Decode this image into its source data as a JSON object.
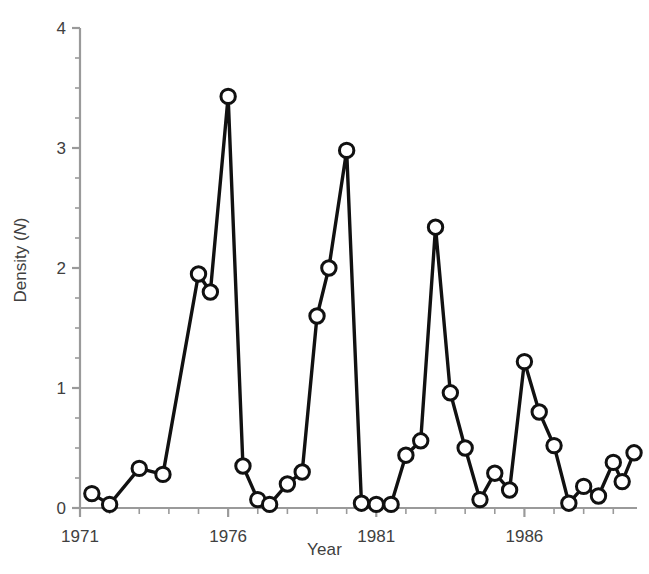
{
  "chart_data": {
    "type": "line",
    "title": "",
    "xlabel": "Year",
    "ylabel": "Density (N)",
    "ylabel_plain": "Density (",
    "ylabel_italic": "N",
    "ylabel_close": ")",
    "xlim": [
      1971.0,
      1989.8
    ],
    "ylim": [
      0,
      4
    ],
    "ytick_labels": [
      "0",
      "1",
      "2",
      "3",
      "4"
    ],
    "ytick_values": [
      0,
      1,
      2,
      3,
      4
    ],
    "yminor_step": 0.25,
    "xtick_labels": [
      "1971",
      "1976",
      "1981",
      "1986"
    ],
    "xtick_values": [
      1971,
      1976,
      1981,
      1986
    ],
    "xminor_step": 1,
    "grid": false,
    "legend": null,
    "marker": "open-circle",
    "marker_facecolor": "#ffffff",
    "marker_edgecolor": "#111111",
    "line_color": "#111111",
    "axis_color": "#9a9a9a",
    "x": [
      1971.4,
      1972.0,
      1973.0,
      1973.8,
      1975.0,
      1975.4,
      1976.0,
      1976.5,
      1977.0,
      1977.4,
      1978.0,
      1978.5,
      1979.0,
      1979.4,
      1980.0,
      1980.5,
      1981.0,
      1981.5,
      1982.0,
      1982.5,
      1983.0,
      1983.5,
      1984.0,
      1984.5,
      1985.0,
      1985.5,
      1986.0,
      1986.5,
      1987.0,
      1987.5,
      1988.0,
      1988.5,
      1989.0,
      1989.5
    ],
    "series": [
      {
        "name": "Density",
        "points": [
          {
            "year": 1971.4,
            "value": 0.12
          },
          {
            "year": 1972.0,
            "value": 0.03
          },
          {
            "year": 1973.0,
            "value": 0.33
          },
          {
            "year": 1973.8,
            "value": 0.28
          },
          {
            "year": 1975.0,
            "value": 1.95
          },
          {
            "year": 1975.4,
            "value": 1.8
          },
          {
            "year": 1976.0,
            "value": 3.43
          },
          {
            "year": 1976.5,
            "value": 0.35
          },
          {
            "year": 1977.0,
            "value": 0.07
          },
          {
            "year": 1977.4,
            "value": 0.03
          },
          {
            "year": 1978.0,
            "value": 0.2
          },
          {
            "year": 1978.5,
            "value": 0.3
          },
          {
            "year": 1979.0,
            "value": 1.6
          },
          {
            "year": 1979.4,
            "value": 2.0
          },
          {
            "year": 1980.0,
            "value": 2.98
          },
          {
            "year": 1980.5,
            "value": 0.04
          },
          {
            "year": 1981.0,
            "value": 0.03
          },
          {
            "year": 1981.5,
            "value": 0.03
          },
          {
            "year": 1982.0,
            "value": 0.44
          },
          {
            "year": 1982.5,
            "value": 0.56
          },
          {
            "year": 1983.0,
            "value": 2.34
          },
          {
            "year": 1983.5,
            "value": 0.96
          },
          {
            "year": 1984.0,
            "value": 0.5
          },
          {
            "year": 1984.5,
            "value": 0.07
          },
          {
            "year": 1985.0,
            "value": 0.29
          },
          {
            "year": 1985.5,
            "value": 0.15
          },
          {
            "year": 1986.0,
            "value": 1.22
          },
          {
            "year": 1986.5,
            "value": 0.8
          },
          {
            "year": 1987.0,
            "value": 0.52
          },
          {
            "year": 1987.5,
            "value": 0.04
          },
          {
            "year": 1988.0,
            "value": 0.18
          },
          {
            "year": 1988.5,
            "value": 0.1
          },
          {
            "year": 1989.0,
            "value": 0.38
          },
          {
            "year": 1989.3,
            "value": 0.22
          },
          {
            "year": 1989.7,
            "value": 0.46
          }
        ]
      }
    ]
  }
}
